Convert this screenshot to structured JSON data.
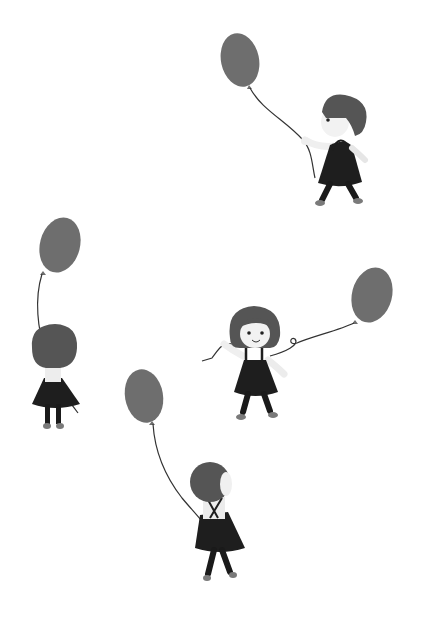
{
  "scene": {
    "description": "Four little girls in pinafore dresses each holding a balloon, drawn in grayscale",
    "background": "#ffffff",
    "colors": {
      "balloon": "#6e6e6e",
      "hair": "#555555",
      "dress": "#1e1e1e",
      "legs": "#1a1a1a",
      "skin": "#f2f2f2",
      "shoe": "#7a7a7a",
      "string": "#333333"
    },
    "figures": [
      {
        "id": "girl-walking-right",
        "pose": "side view walking, balloon trailing behind upper-left"
      },
      {
        "id": "girl-back-left",
        "pose": "back view, balloon above"
      },
      {
        "id": "girl-front-center",
        "pose": "front view smiling, arms out, balloon to the right"
      },
      {
        "id": "girl-back-bottom",
        "pose": "back view, balloon to upper-left"
      }
    ]
  }
}
